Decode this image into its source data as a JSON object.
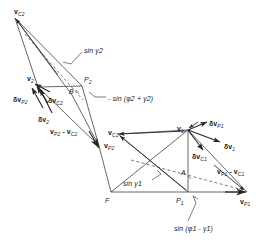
{
  "figure": {
    "type": "vector-velocity-diagram",
    "background": "#ffffff",
    "line_color": "#262626",
    "width": 269,
    "height": 243
  },
  "labels": {
    "v_C2": "v",
    "v_C2_sub": "C",
    "v_C2_sub2": "2",
    "sin_gamma2": "sin γ2",
    "sin_phi2_plus_gamma2": "- sin (φ2 + γ2)",
    "v2": "v",
    "v2_sub": "2",
    "P2": "P",
    "P2_sub": "2",
    "B": "B",
    "dv_P2": "δv",
    "dv_P2_sub": "P2",
    "dv_C2": "δv",
    "dv_C2_sub": "C2",
    "dv_2": "δv",
    "dv_2_sub": "2",
    "vP2_minus_vC2": "v",
    "vP2_minus_vC2_sub": "P2",
    "vP2_minus_vC2_tail": "- v",
    "vP2_minus_vC2_tailsub": "C2",
    "v_P2": "v",
    "v_P2_sub": "P2",
    "F": "F",
    "v_C1": "v",
    "v_C1_sub": "C1",
    "sin_gamma1": "sin γ1",
    "sin_phi1_minus_gamma1": "sin (φ1 - γ1)",
    "v1": "v",
    "v1_sub": "1",
    "dv_P1": "δv",
    "dv_P1_sub": "P1",
    "dv_1": "δv",
    "dv_1_sub": "1",
    "dv_C1": "δv",
    "dv_C1_sub": "C1",
    "A": "A",
    "P1": "P",
    "P1_sub": "1",
    "vP1_minus_vC1": "v",
    "vP1_minus_vC1_sub": "P1",
    "vP1_minus_vC1_tail": "- v",
    "vP1_minus_vC1_tailsub": "C1",
    "v_P1": "v",
    "v_P1_sub": "P1"
  },
  "text_items": [
    {
      "id": "v-C2",
      "text": "v",
      "sub": "C2",
      "x": 14,
      "y": 8,
      "vector": true
    },
    {
      "id": "sin-gamma2",
      "text": "sin γ2",
      "sub": "",
      "x": 84,
      "y": 47,
      "vector": false
    },
    {
      "id": "v2",
      "text": "v",
      "sub": "2",
      "x": 27,
      "y": 75,
      "vector": true
    },
    {
      "id": "P2",
      "text": "P",
      "sub": "2",
      "x": 84,
      "y": 76,
      "vector": false
    },
    {
      "id": "B",
      "text": "B",
      "sub": "",
      "x": 69,
      "y": 88,
      "vector": false
    },
    {
      "id": "sin-phi2-gamma2",
      "text": "- sin (φ2 + γ2)",
      "sub": "",
      "x": 108,
      "y": 95,
      "vector": false
    },
    {
      "id": "dv-P2",
      "text": "δv",
      "sub": "P2",
      "x": 13,
      "y": 96,
      "vector": true
    },
    {
      "id": "dv-C2",
      "text": "δv",
      "sub": "C2",
      "x": 48,
      "y": 97,
      "vector": true
    },
    {
      "id": "dv-2",
      "text": "δv",
      "sub": "2",
      "x": 38,
      "y": 116,
      "vector": true
    },
    {
      "id": "vP2-minus-vC2",
      "text": "v",
      "sub": "P2",
      "x": 50,
      "y": 128,
      "vector": true,
      "tail": "- v",
      "tailsub": "C2"
    },
    {
      "id": "v-P2",
      "text": "v",
      "sub": "P2",
      "x": 104,
      "y": 142,
      "vector": true
    },
    {
      "id": "v-C1",
      "text": "v",
      "sub": "C1",
      "x": 108,
      "y": 129,
      "vector": true
    },
    {
      "id": "v1",
      "text": "v",
      "sub": "1",
      "x": 177,
      "y": 125,
      "vector": true
    },
    {
      "id": "dv-P1",
      "text": "δv",
      "sub": "P1",
      "x": 209,
      "y": 120,
      "vector": true
    },
    {
      "id": "dv-1",
      "text": "δv",
      "sub": "1",
      "x": 224,
      "y": 143,
      "vector": true
    },
    {
      "id": "dv-C1",
      "text": "δv",
      "sub": "C1",
      "x": 192,
      "y": 153,
      "vector": true
    },
    {
      "id": "vP1-minus-vC1",
      "text": "v",
      "sub": "P1",
      "x": 217,
      "y": 168,
      "vector": true,
      "tail": "- v",
      "tailsub": "C1"
    },
    {
      "id": "A",
      "text": "A",
      "sub": "",
      "x": 181,
      "y": 169,
      "vector": false
    },
    {
      "id": "sin-gamma1",
      "text": "sin γ1",
      "sub": "",
      "x": 123,
      "y": 180,
      "vector": false
    },
    {
      "id": "F",
      "text": "F",
      "sub": "",
      "x": 105,
      "y": 197,
      "vector": false
    },
    {
      "id": "P1",
      "text": "P",
      "sub": "1",
      "x": 176,
      "y": 197,
      "vector": false
    },
    {
      "id": "v-P1",
      "text": "v",
      "sub": "P1",
      "x": 240,
      "y": 198,
      "vector": true
    },
    {
      "id": "sin-phi1-gamma1",
      "text": "sin (φ1 - γ1)",
      "sub": "",
      "x": 174,
      "y": 225,
      "vector": false
    }
  ],
  "geometry": {
    "left_group": {
      "apex_vC2": [
        15,
        18
      ],
      "v2_point": [
        38,
        87
      ],
      "P2_point": [
        82,
        86
      ],
      "B_point": [
        72,
        94
      ],
      "vP2_point": [
        99,
        146
      ],
      "F_point": [
        111,
        192
      ]
    },
    "right_group": {
      "vC1_point": [
        118,
        134
      ],
      "v1_point": [
        188,
        130
      ],
      "P1_point": [
        188,
        192
      ],
      "vP1_point": [
        245,
        192
      ],
      "F_point": [
        111,
        192
      ],
      "A_point": [
        188,
        170
      ]
    }
  }
}
